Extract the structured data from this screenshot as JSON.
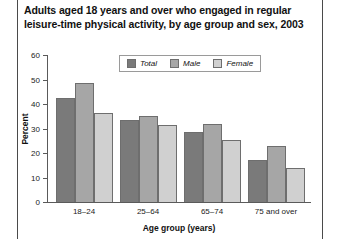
{
  "figure": {
    "title": "Adults aged 18 years and over who engaged in regular leisure-time physical activity, by age group and sex, 2003"
  },
  "legend": {
    "items": [
      {
        "label": "Total",
        "color": "#7a7a7a"
      },
      {
        "label": "Male",
        "color": "#a6a6a6"
      },
      {
        "label": "Female",
        "color": "#d0d0d0"
      }
    ]
  },
  "axes": {
    "ylabel": "Percent",
    "xlabel": "Age group (years)",
    "yticks": [
      "0",
      "10",
      "20",
      "30",
      "40",
      "50",
      "60"
    ]
  },
  "chart_data": {
    "type": "bar",
    "title": "Adults aged 18 years and over who engaged in regular leisure-time physical activity, by age group and sex, 2003",
    "xlabel": "Age group (years)",
    "ylabel": "Percent",
    "ylim": [
      0,
      60
    ],
    "ytick_step": 10,
    "grid": false,
    "legend_position": "top-center",
    "categories": [
      "18–24",
      "25–64",
      "65–74",
      "75 and over"
    ],
    "series": [
      {
        "name": "Total",
        "color": "#7a7a7a",
        "values": [
          42.5,
          33.5,
          28.5,
          17.0
        ]
      },
      {
        "name": "Male",
        "color": "#a6a6a6",
        "values": [
          48.5,
          35.0,
          32.0,
          23.0
        ]
      },
      {
        "name": "Female",
        "color": "#d0d0d0",
        "values": [
          36.5,
          31.5,
          25.5,
          14.0
        ]
      }
    ]
  }
}
